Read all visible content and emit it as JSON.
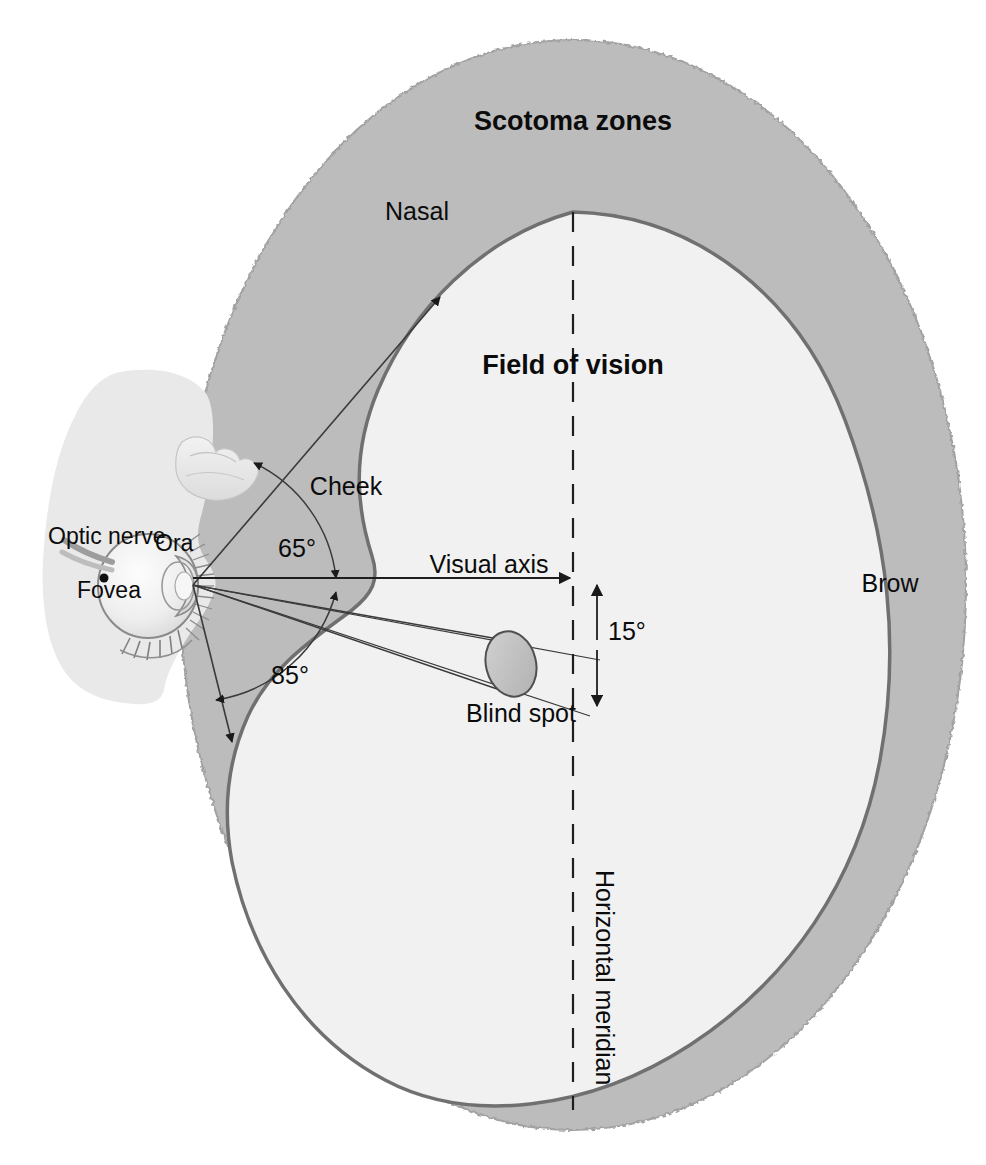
{
  "figure": {
    "title": "Scotoma zones"
  },
  "labels": {
    "scotoma_zones": "Scotoma zones",
    "field_of_vision": "Field of vision",
    "nasal": "Nasal",
    "cheek": "Cheek",
    "brow": "Brow",
    "visual_axis": "Visual axis",
    "blind_spot": "Blind spot",
    "horizontal_meridian": "Horizontal meridian",
    "optic_nerve": "Optic nerve",
    "ora": "Ora",
    "fovea": "Fovea"
  },
  "angles": {
    "upper": "65°",
    "lower": "85°",
    "blind_spot_offset": "15°"
  },
  "colors": {
    "background": "#ffffff",
    "scotoma_fill": "#bcbcbc",
    "field_fill": "#f1f1f1",
    "head_fill": "#e9e9e9",
    "outline": "#6e6e6e",
    "field_outline": "#707070",
    "line": "#3a3a3a",
    "text": "#0b0b0b",
    "blind_spot_fill": "#c2c2c2"
  },
  "geometry": {
    "eye_node": {
      "x": 193,
      "y": 585
    },
    "meridian_x": 573,
    "visual_axis_y": 578
  }
}
